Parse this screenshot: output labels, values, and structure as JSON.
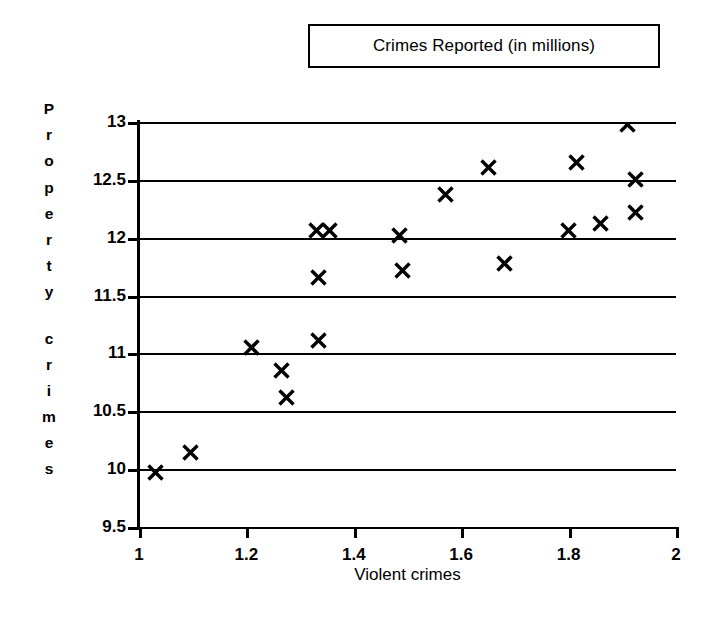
{
  "chart_data": {
    "type": "scatter",
    "title": "Crimes Reported (in millions)",
    "xlabel": "Violent crimes",
    "ylabel": "Property crimes",
    "xlim": [
      1,
      2
    ],
    "ylim": [
      9.5,
      13
    ],
    "xticks": [
      "1",
      "1.2",
      "1.4",
      "1.6",
      "1.8",
      "2"
    ],
    "xtick_values": [
      1,
      1.2,
      1.4,
      1.6,
      1.8,
      2
    ],
    "yticks": [
      "9.5",
      "10",
      "10.5",
      "11",
      "11.5",
      "12",
      "12.5",
      "13"
    ],
    "ytick_values": [
      9.5,
      10,
      10.5,
      11,
      11.5,
      12,
      12.5,
      13
    ],
    "grid": "horizontal",
    "legend": "none",
    "marker": "x",
    "marker_color": "#000000",
    "points": [
      {
        "x": 1.03,
        "y": 9.97
      },
      {
        "x": 1.095,
        "y": 10.14
      },
      {
        "x": 1.21,
        "y": 11.05
      },
      {
        "x": 1.265,
        "y": 10.85
      },
      {
        "x": 1.275,
        "y": 10.62
      },
      {
        "x": 1.335,
        "y": 11.11
      },
      {
        "x": 1.335,
        "y": 11.66
      },
      {
        "x": 1.33,
        "y": 12.06
      },
      {
        "x": 1.355,
        "y": 12.06
      },
      {
        "x": 1.485,
        "y": 12.02
      },
      {
        "x": 1.49,
        "y": 11.72
      },
      {
        "x": 1.57,
        "y": 12.37
      },
      {
        "x": 1.65,
        "y": 12.61
      },
      {
        "x": 1.68,
        "y": 11.78
      },
      {
        "x": 1.8,
        "y": 12.06
      },
      {
        "x": 1.815,
        "y": 12.65
      },
      {
        "x": 1.86,
        "y": 12.12
      },
      {
        "x": 1.91,
        "y": 12.98
      },
      {
        "x": 1.925,
        "y": 12.5
      },
      {
        "x": 1.925,
        "y": 12.22
      }
    ]
  },
  "y_axis_title_letters": [
    "P",
    "r",
    "o",
    "p",
    "e",
    "r",
    "t",
    "y",
    "",
    "c",
    "r",
    "i",
    "m",
    "e",
    "s"
  ]
}
